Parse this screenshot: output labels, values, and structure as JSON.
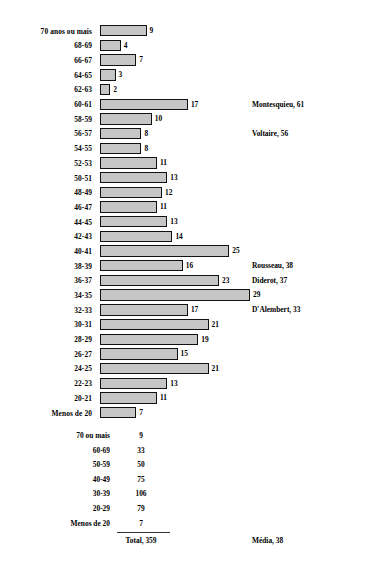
{
  "chart_data": {
    "type": "bar",
    "orientation": "horizontal",
    "title": "",
    "subtitle": "",
    "xlabel": "",
    "ylabel": "",
    "grid": false,
    "legend": null,
    "xlim": [
      0,
      29
    ],
    "value_labels_shown": true,
    "categories": [
      "70 anos ou mais",
      "68-69",
      "66-67",
      "64-65",
      "62-63",
      "60-61",
      "58-59",
      "56-57",
      "54-55",
      "52-53",
      "50-51",
      "48-49",
      "46-47",
      "44-45",
      "42-43",
      "40-41",
      "38-39",
      "36-37",
      "34-35",
      "32-33",
      "30-31",
      "28-29",
      "26-27",
      "24-25",
      "22-23",
      "20-21",
      "Menos de 20"
    ],
    "values": [
      9,
      4,
      7,
      3,
      2,
      17,
      10,
      8,
      8,
      11,
      13,
      12,
      11,
      13,
      14,
      25,
      16,
      23,
      29,
      17,
      21,
      19,
      15,
      21,
      13,
      11,
      7
    ],
    "annotations": [
      {
        "text": "Montesquieu, 61",
        "category": "60-61"
      },
      {
        "text": "Voltaire, 56",
        "category": "56-57"
      },
      {
        "text": "Rousseau, 38",
        "category": "38-39"
      },
      {
        "text": "Diderot, 37",
        "category": "36-37"
      },
      {
        "text": "D'Alembert, 33",
        "category": "32-33"
      }
    ],
    "bar_fill_color": "#c6c6c6",
    "bar_edge_color": "#111111"
  },
  "summary_table": {
    "rows": [
      {
        "label": "70 ou mais",
        "value": "9"
      },
      {
        "label": "60-69",
        "value": "33"
      },
      {
        "label": "50-59",
        "value": "50"
      },
      {
        "label": "40-49",
        "value": "75"
      },
      {
        "label": "30-39",
        "value": "106"
      },
      {
        "label": "20-29",
        "value": "79"
      },
      {
        "label": "Menos de 20",
        "value": "7"
      }
    ],
    "total_label": "Total, 359",
    "mean_label": "Média, 38"
  }
}
